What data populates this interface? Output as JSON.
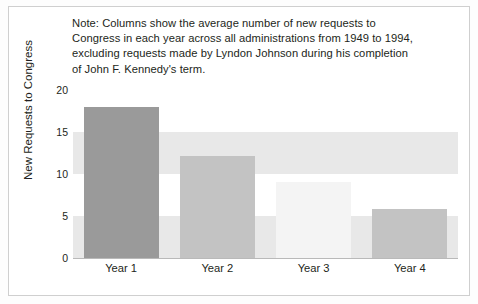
{
  "figure": {
    "background_color": "#ffffff",
    "frame_color": "#cfcfcf"
  },
  "note": {
    "lines": [
      "Note: Columns show the average number of new requests to",
      "Congress in each year across all administrations from 1949 to 1994,",
      "excluding requests made by Lyndon Johnson during his completion",
      "of John F. Kennedy's term."
    ],
    "full_text": "Note: Columns show the average number of new requests to Congress in each year across all administrations from 1949 to 1994, excluding requests made by Lyndon Johnson during his completion of John F. Kennedy's term."
  },
  "chart_data": {
    "type": "bar",
    "title": "",
    "subtitle": "",
    "categories": [
      "Year 1",
      "Year 2",
      "Year 3",
      "Year 4"
    ],
    "values": [
      18.0,
      12.2,
      9.0,
      5.8
    ],
    "bar_colors": [
      "#9a9a9a",
      "#c3c3c3",
      "#f4f4f4",
      "#c3c3c3"
    ],
    "xlabel": "",
    "ylabel": "New Requests to Congress",
    "ylim": [
      0,
      20
    ],
    "yticks": [
      0,
      5,
      10,
      15,
      20
    ],
    "ytick_labels": [
      "0",
      "5",
      "10",
      "15",
      "20"
    ],
    "grid": "horizontal-bands",
    "band_color": "#e8e8e8",
    "legend": "none",
    "annotations": []
  }
}
